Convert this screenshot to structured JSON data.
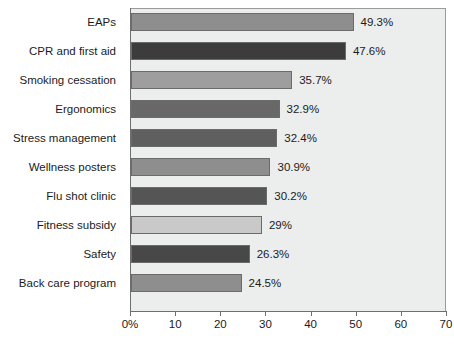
{
  "chart_data": {
    "type": "bar",
    "orientation": "horizontal",
    "title": "",
    "xlabel": "",
    "ylabel": "",
    "categories": [
      "EAPs",
      "CPR and first aid",
      "Smoking cessation",
      "Ergonomics",
      "Stress management",
      "Wellness posters",
      "Flu shot clinic",
      "Fitness subsidy",
      "Safety",
      "Back care program"
    ],
    "values": [
      49.3,
      47.6,
      35.7,
      32.9,
      32.4,
      30.9,
      30.2,
      29,
      26.3,
      24.5
    ],
    "value_labels": [
      "49.3%",
      "47.6%",
      "35.7%",
      "32.9%",
      "32.4%",
      "30.9%",
      "30.2%",
      "29%",
      "26.3%",
      "24.5%"
    ],
    "bar_colors": [
      "#8e8e8e",
      "#3c3c3c",
      "#9e9e9e",
      "#686868",
      "#5f5f5f",
      "#8e8e8e",
      "#555555",
      "#c9c9c9",
      "#484848",
      "#8e8e8e"
    ],
    "xlim": [
      0,
      70
    ],
    "xticks": [
      0,
      10,
      20,
      30,
      40,
      50,
      60,
      70
    ],
    "xtick_labels": [
      "0%",
      "10",
      "20",
      "30",
      "40",
      "50",
      "60",
      "70"
    ],
    "grid": false,
    "legend": null,
    "plot_background": "#eceded",
    "axis_color": "#6e6e6e"
  }
}
